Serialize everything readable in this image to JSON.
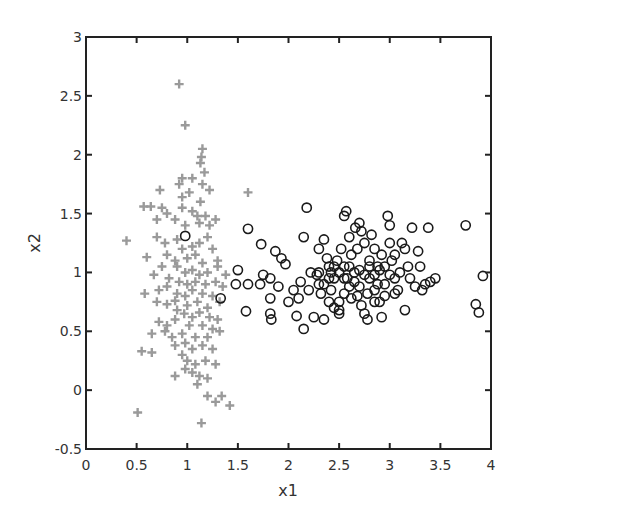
{
  "chart_data": {
    "type": "scatter",
    "title": "",
    "xlabel": "x1",
    "ylabel": "x2",
    "xlim": [
      0,
      4
    ],
    "ylim": [
      -0.5,
      3
    ],
    "xticks": [
      "0",
      "0.5",
      "1",
      "1.5",
      "2",
      "2.5",
      "3",
      "3.5",
      "4"
    ],
    "yticks": [
      "-0.5",
      "0",
      "0.5",
      "1",
      "1.5",
      "2",
      "2.5",
      "3"
    ],
    "grid": false,
    "legend": null,
    "colors": {
      "class1": "#9a9a9a",
      "class2": "#1a1a1a",
      "axis": "#222222"
    },
    "series": [
      {
        "name": "class 1 (+)",
        "marker": "plus",
        "points": [
          [
            0.92,
            2.6
          ],
          [
            0.98,
            2.25
          ],
          [
            1.15,
            2.05
          ],
          [
            1.14,
            1.98
          ],
          [
            1.13,
            1.93
          ],
          [
            1.17,
            1.85
          ],
          [
            1.05,
            1.8
          ],
          [
            0.92,
            1.75
          ],
          [
            0.95,
            1.8
          ],
          [
            1.15,
            1.75
          ],
          [
            1.22,
            1.7
          ],
          [
            0.73,
            1.7
          ],
          [
            0.95,
            1.64
          ],
          [
            1.02,
            1.68
          ],
          [
            1.13,
            1.6
          ],
          [
            1.6,
            1.68
          ],
          [
            0.57,
            1.56
          ],
          [
            0.64,
            1.56
          ],
          [
            0.75,
            1.55
          ],
          [
            0.8,
            1.5
          ],
          [
            0.95,
            1.55
          ],
          [
            1.05,
            1.52
          ],
          [
            1.1,
            1.48
          ],
          [
            1.18,
            1.48
          ],
          [
            0.7,
            1.45
          ],
          [
            0.88,
            1.45
          ],
          [
            0.98,
            1.4
          ],
          [
            1.12,
            1.42
          ],
          [
            1.22,
            1.4
          ],
          [
            1.28,
            1.45
          ],
          [
            0.4,
            1.27
          ],
          [
            0.7,
            1.3
          ],
          [
            0.78,
            1.25
          ],
          [
            0.9,
            1.28
          ],
          [
            0.95,
            1.2
          ],
          [
            1.05,
            1.22
          ],
          [
            1.12,
            1.25
          ],
          [
            1.2,
            1.3
          ],
          [
            1.25,
            1.2
          ],
          [
            0.8,
            1.15
          ],
          [
            0.88,
            1.1
          ],
          [
            1.0,
            1.12
          ],
          [
            1.08,
            1.15
          ],
          [
            1.15,
            1.08
          ],
          [
            1.3,
            1.1
          ],
          [
            0.6,
            1.13
          ],
          [
            0.75,
            1.05
          ],
          [
            0.9,
            1.05
          ],
          [
            0.98,
            1.0
          ],
          [
            1.05,
            1.02
          ],
          [
            1.12,
            0.98
          ],
          [
            1.2,
            1.0
          ],
          [
            1.3,
            1.05
          ],
          [
            1.38,
            0.98
          ],
          [
            0.67,
            0.98
          ],
          [
            0.82,
            0.95
          ],
          [
            0.92,
            0.92
          ],
          [
            1.0,
            0.9
          ],
          [
            1.08,
            0.92
          ],
          [
            1.18,
            0.9
          ],
          [
            1.28,
            0.92
          ],
          [
            0.72,
            0.85
          ],
          [
            0.8,
            0.88
          ],
          [
            0.9,
            0.82
          ],
          [
            0.98,
            0.8
          ],
          [
            1.05,
            0.85
          ],
          [
            1.15,
            0.82
          ],
          [
            1.25,
            0.8
          ],
          [
            1.35,
            0.88
          ],
          [
            0.58,
            0.82
          ],
          [
            0.7,
            0.75
          ],
          [
            0.8,
            0.73
          ],
          [
            0.88,
            0.76
          ],
          [
            1.0,
            0.72
          ],
          [
            1.1,
            0.75
          ],
          [
            1.2,
            0.7
          ],
          [
            1.32,
            0.75
          ],
          [
            0.9,
            0.68
          ],
          [
            0.97,
            0.65
          ],
          [
            1.05,
            0.62
          ],
          [
            1.12,
            0.66
          ],
          [
            1.22,
            0.62
          ],
          [
            1.3,
            0.6
          ],
          [
            0.72,
            0.58
          ],
          [
            0.8,
            0.55
          ],
          [
            0.88,
            0.6
          ],
          [
            1.02,
            0.55
          ],
          [
            1.15,
            0.55
          ],
          [
            1.25,
            0.52
          ],
          [
            0.65,
            0.48
          ],
          [
            0.78,
            0.5
          ],
          [
            0.85,
            0.45
          ],
          [
            0.95,
            0.48
          ],
          [
            1.08,
            0.45
          ],
          [
            1.2,
            0.45
          ],
          [
            1.32,
            0.5
          ],
          [
            0.88,
            0.38
          ],
          [
            0.98,
            0.4
          ],
          [
            1.05,
            0.35
          ],
          [
            1.15,
            0.38
          ],
          [
            1.25,
            0.35
          ],
          [
            0.55,
            0.33
          ],
          [
            0.65,
            0.32
          ],
          [
            0.95,
            0.3
          ],
          [
            1.0,
            0.25
          ],
          [
            1.08,
            0.22
          ],
          [
            1.18,
            0.25
          ],
          [
            1.28,
            0.22
          ],
          [
            0.98,
            0.18
          ],
          [
            1.05,
            0.15
          ],
          [
            1.12,
            0.12
          ],
          [
            0.88,
            0.12
          ],
          [
            1.2,
            0.1
          ],
          [
            1.1,
            0.05
          ],
          [
            1.2,
            -0.05
          ],
          [
            1.28,
            -0.1
          ],
          [
            1.34,
            -0.05
          ],
          [
            1.42,
            -0.13
          ],
          [
            0.51,
            -0.19
          ],
          [
            1.14,
            -0.28
          ]
        ]
      },
      {
        "name": "class 2 (o)",
        "marker": "circle",
        "points": [
          [
            0.98,
            1.31
          ],
          [
            1.33,
            0.78
          ],
          [
            1.5,
            1.02
          ],
          [
            1.48,
            0.9
          ],
          [
            1.6,
            1.37
          ],
          [
            1.6,
            0.9
          ],
          [
            1.58,
            0.67
          ],
          [
            1.72,
            0.9
          ],
          [
            1.73,
            1.24
          ],
          [
            1.75,
            0.98
          ],
          [
            1.82,
            0.95
          ],
          [
            1.82,
            0.78
          ],
          [
            1.82,
            0.65
          ],
          [
            1.83,
            0.6
          ],
          [
            1.87,
            1.18
          ],
          [
            1.9,
            0.88
          ],
          [
            1.93,
            1.12
          ],
          [
            1.97,
            1.07
          ],
          [
            2.0,
            0.75
          ],
          [
            2.05,
            0.85
          ],
          [
            2.08,
            0.63
          ],
          [
            2.12,
            0.92
          ],
          [
            2.15,
            0.52
          ],
          [
            2.18,
            1.55
          ],
          [
            2.15,
            1.3
          ],
          [
            2.2,
            0.85
          ],
          [
            2.1,
            0.78
          ],
          [
            2.25,
            0.62
          ],
          [
            2.22,
            1.0
          ],
          [
            2.28,
            0.98
          ],
          [
            2.3,
            1.2
          ],
          [
            2.3,
            0.9
          ],
          [
            2.32,
            0.82
          ],
          [
            2.35,
            1.28
          ],
          [
            2.38,
            1.12
          ],
          [
            2.4,
            1.05
          ],
          [
            2.42,
            1.0
          ],
          [
            2.45,
            0.95
          ],
          [
            2.42,
            0.85
          ],
          [
            2.48,
            1.1
          ],
          [
            2.5,
            0.75
          ],
          [
            2.5,
            0.68
          ],
          [
            2.55,
            1.48
          ],
          [
            2.57,
            1.52
          ],
          [
            2.6,
            1.3
          ],
          [
            2.52,
            1.2
          ],
          [
            2.55,
            1.05
          ],
          [
            2.58,
            0.95
          ],
          [
            2.6,
            0.88
          ],
          [
            2.62,
            1.15
          ],
          [
            2.65,
            1.0
          ],
          [
            2.66,
            1.38
          ],
          [
            2.7,
            1.42
          ],
          [
            2.72,
            1.35
          ],
          [
            2.75,
            1.25
          ],
          [
            2.68,
            0.8
          ],
          [
            2.72,
            0.72
          ],
          [
            2.75,
            0.65
          ],
          [
            2.78,
            0.6
          ],
          [
            2.8,
            1.1
          ],
          [
            2.8,
            0.95
          ],
          [
            2.82,
            1.32
          ],
          [
            2.85,
            1.2
          ],
          [
            2.85,
            0.85
          ],
          [
            2.88,
            1.05
          ],
          [
            2.9,
            0.75
          ],
          [
            2.92,
            0.62
          ],
          [
            2.95,
            0.9
          ],
          [
            2.98,
            1.48
          ],
          [
            3.0,
            1.4
          ],
          [
            3.02,
            1.1
          ],
          [
            3.05,
            1.15
          ],
          [
            3.05,
            0.95
          ],
          [
            3.08,
            0.85
          ],
          [
            3.1,
            1.0
          ],
          [
            3.12,
            1.25
          ],
          [
            3.15,
            1.2
          ],
          [
            3.15,
            0.68
          ],
          [
            3.18,
            1.05
          ],
          [
            3.2,
            0.95
          ],
          [
            3.22,
            1.38
          ],
          [
            3.25,
            0.88
          ],
          [
            3.28,
            1.18
          ],
          [
            3.3,
            1.05
          ],
          [
            3.32,
            0.85
          ],
          [
            3.35,
            0.9
          ],
          [
            3.38,
            1.38
          ],
          [
            3.4,
            0.92
          ],
          [
            3.45,
            0.95
          ],
          [
            2.3,
            1.0
          ],
          [
            2.35,
            0.9
          ],
          [
            2.4,
            0.95
          ],
          [
            2.45,
            1.05
          ],
          [
            2.5,
            1.0
          ],
          [
            2.55,
            0.95
          ],
          [
            2.6,
            1.05
          ],
          [
            2.65,
            0.92
          ],
          [
            2.7,
            1.02
          ],
          [
            2.75,
            0.98
          ],
          [
            2.8,
            1.05
          ],
          [
            2.85,
            0.98
          ],
          [
            2.9,
            1.02
          ],
          [
            2.95,
            1.05
          ],
          [
            3.0,
            0.98
          ],
          [
            2.55,
            0.82
          ],
          [
            2.62,
            0.78
          ],
          [
            2.7,
            0.88
          ],
          [
            2.78,
            0.82
          ],
          [
            2.88,
            0.9
          ],
          [
            2.4,
            0.75
          ],
          [
            2.45,
            0.7
          ],
          [
            2.85,
            0.75
          ],
          [
            2.95,
            0.8
          ],
          [
            3.05,
            0.82
          ],
          [
            2.35,
            0.6
          ],
          [
            2.5,
            0.65
          ],
          [
            2.68,
            1.2
          ],
          [
            2.92,
            1.15
          ],
          [
            3.0,
            1.25
          ],
          [
            3.75,
            1.4
          ],
          [
            3.85,
            0.73
          ],
          [
            3.88,
            0.66
          ],
          [
            3.92,
            0.97
          ]
        ]
      }
    ]
  }
}
